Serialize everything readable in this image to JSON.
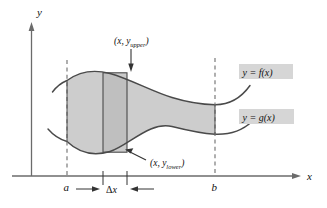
{
  "figure": {
    "axes": {
      "x_label": "x",
      "y_label": "y"
    },
    "bounds": {
      "left_label": "a",
      "right_label": "b"
    },
    "curve_labels": {
      "upper": "y = f(x)",
      "lower": "y = g(x)"
    },
    "point_labels": {
      "upper_prefix": "(x, y",
      "upper_sub": "upper",
      "upper_suffix": ")",
      "lower_prefix": "(x, y",
      "lower_sub": "lower",
      "lower_suffix": ")"
    },
    "width_marker": {
      "delta": "Δ",
      "variable": "x"
    },
    "colors": {
      "region_fill": "#cdcdcd",
      "rect_fill": "#b9b9b9",
      "curve_stroke": "#4a4a4a",
      "axis_stroke": "#6b6b6b",
      "dashed_stroke": "#7a7a7a",
      "label_box": "#d6d6d6",
      "text": "#111111"
    }
  }
}
